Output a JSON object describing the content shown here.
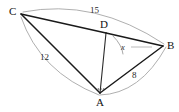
{
  "figure": {
    "type": "geometry-diagram",
    "vertices": [
      {
        "name": "A",
        "label": "A",
        "x": 100,
        "y": 93
      },
      {
        "name": "B",
        "label": "B",
        "x": 163,
        "y": 46
      },
      {
        "name": "C",
        "label": "C",
        "x": 21,
        "y": 14
      },
      {
        "name": "D",
        "label": "D",
        "x": 106,
        "y": 33
      }
    ],
    "segments": [
      {
        "name": "segment-CD",
        "from": "C",
        "to": "D",
        "style": "bold"
      },
      {
        "name": "segment-DB",
        "from": "D",
        "to": "B",
        "style": "bold"
      },
      {
        "name": "segment-CA",
        "from": "C",
        "to": "A",
        "style": "bold"
      },
      {
        "name": "segment-AD",
        "from": "A",
        "to": "D",
        "style": "bold"
      },
      {
        "name": "segment-AB",
        "from": "A",
        "to": "B",
        "style": "bold"
      }
    ],
    "measures": [
      {
        "name": "measure-CB",
        "label": "15",
        "between": [
          "C",
          "B"
        ]
      },
      {
        "name": "measure-CA",
        "label": "12",
        "between": [
          "C",
          "A"
        ]
      },
      {
        "name": "measure-AB",
        "label": "8",
        "between": [
          "A",
          "B"
        ]
      }
    ],
    "angles": [
      {
        "name": "angle-DBA",
        "label": "x",
        "at": "B",
        "between": [
          "D",
          "A"
        ]
      }
    ],
    "colors": {
      "line": "#1a1a1a",
      "arc": "#9a9a9a",
      "text": "#111111",
      "background": "#ffffff"
    }
  }
}
